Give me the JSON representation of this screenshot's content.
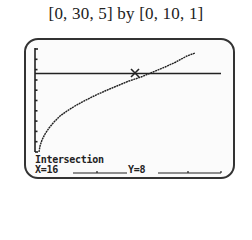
{
  "caption": "[0, 30, 5] by [0, 10, 1]",
  "calculator_screen": {
    "window": {
      "xmin": 0,
      "xmax": 30,
      "xscl": 5,
      "ymin": 0,
      "ymax": 10,
      "yscl": 1
    },
    "curves": [
      {
        "name": "increasing-root-curve",
        "description": "concave-down increasing curve from origin"
      },
      {
        "name": "horizontal-line",
        "y": 8
      }
    ],
    "intersection_label": "Intersection",
    "x_readout": "X=16",
    "y_readout": "Y=8",
    "cursor_marker": "x-cross-cursor"
  }
}
